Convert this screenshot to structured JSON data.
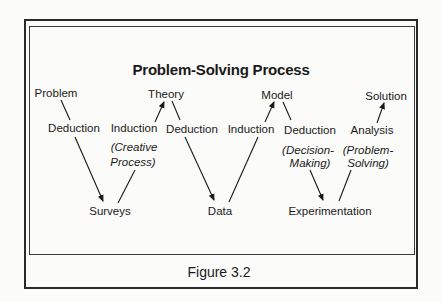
{
  "diagram": {
    "title": "Problem-Solving Process",
    "caption": "Figure 3.2",
    "top_nodes": {
      "problem": "Problem",
      "theory": "Theory",
      "model": "Model",
      "solution": "Solution"
    },
    "middle_nodes": {
      "deduction_1": "Deduction",
      "induction_1": "Induction",
      "induction_1_note_line1": "(Creative",
      "induction_1_note_line2": "Process)",
      "deduction_2": "Deduction",
      "induction_2": "Induction",
      "deduction_3": "Deduction",
      "deduction_3_note_line1": "(Decision-",
      "deduction_3_note_line2": "Making)",
      "analysis": "Analysis",
      "analysis_note_line1": "(Problem-",
      "analysis_note_line2": "Solving)"
    },
    "bottom_nodes": {
      "surveys": "Surveys",
      "data": "Data",
      "experimentation": "Experimentation"
    },
    "edges": [
      {
        "from": "Problem",
        "via": "Deduction",
        "to": "Surveys",
        "arrow": "down"
      },
      {
        "from": "Surveys",
        "via": "Induction (Creative Process)",
        "to": "Theory",
        "arrow": "up"
      },
      {
        "from": "Theory",
        "via": "Deduction",
        "to": "Data",
        "arrow": "down"
      },
      {
        "from": "Data",
        "via": "Induction",
        "to": "Model",
        "arrow": "up"
      },
      {
        "from": "Model",
        "via": "Deduction (Decision-Making)",
        "to": "Experimentation",
        "arrow": "down"
      },
      {
        "from": "Experimentation",
        "via": "Analysis (Problem-Solving)",
        "to": "Solution",
        "arrow": "up"
      }
    ],
    "colors": {
      "ink": "#1a1a1a",
      "paper": "#fbfbf9",
      "frame": "#2a2a2a"
    }
  }
}
